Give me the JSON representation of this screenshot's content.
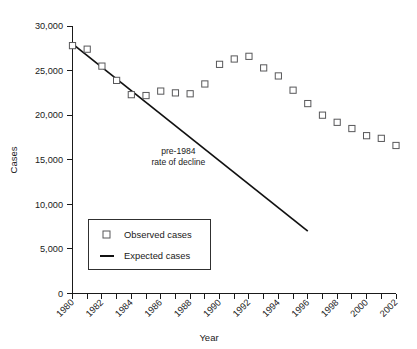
{
  "chart_data": {
    "type": "scatter",
    "title": "",
    "xlabel": "Year",
    "ylabel": "Cases",
    "xlim": [
      1980,
      2002
    ],
    "ylim": [
      0,
      30000
    ],
    "grid": false,
    "legend_position": "inner-left-lower",
    "y_ticks": [
      0,
      5000,
      10000,
      15000,
      20000,
      25000,
      30000
    ],
    "y_tick_labels": [
      "0",
      "5,000",
      "10,000",
      "15,000",
      "20,000",
      "25,000",
      "30,000"
    ],
    "x_ticks": [
      1980,
      1981,
      1982,
      1983,
      1984,
      1985,
      1986,
      1987,
      1988,
      1989,
      1990,
      1991,
      1992,
      1993,
      1994,
      1995,
      1996,
      1997,
      1998,
      1999,
      2000,
      2001,
      2002
    ],
    "x_tick_labels": [
      "1980",
      "",
      "1982",
      "",
      "1984",
      "",
      "1986",
      "",
      "1988",
      "",
      "1990",
      "",
      "1992",
      "",
      "1994",
      "",
      "1996",
      "",
      "1998",
      "",
      "2000",
      "",
      "2002"
    ],
    "x_labeled_ticks": [
      1980,
      1982,
      1984,
      1986,
      1988,
      1990,
      1992,
      1994,
      1996,
      1998,
      2000,
      2002
    ],
    "series": [
      {
        "name": "Observed cases",
        "type": "scatter",
        "marker": "open-square",
        "color": "#58585a",
        "x": [
          1980,
          1981,
          1982,
          1983,
          1984,
          1985,
          1986,
          1987,
          1988,
          1989,
          1990,
          1991,
          1992,
          1993,
          1994,
          1995,
          1996,
          1997,
          1998,
          1999,
          2000,
          2001,
          2002
        ],
        "values": [
          27800,
          27400,
          25500,
          23900,
          22300,
          22200,
          22700,
          22500,
          22400,
          23500,
          25700,
          26300,
          26600,
          25300,
          24400,
          22800,
          21300,
          20000,
          19200,
          18500,
          17700,
          17400,
          16600
        ]
      },
      {
        "name": "Expected cases",
        "type": "line",
        "color": "#111111",
        "x": [
          1980,
          1996
        ],
        "values": [
          28000,
          7000
        ]
      }
    ],
    "annotations": [
      {
        "name": "pre-1984-rate-of-decline",
        "line1": "pre-1984",
        "line2": "rate of decline",
        "x": 1987.2,
        "y": 15600
      }
    ],
    "legend": {
      "items": [
        {
          "label": "Observed cases",
          "marker": "open-square"
        },
        {
          "label": "Expected cases",
          "marker": "line"
        }
      ]
    }
  }
}
